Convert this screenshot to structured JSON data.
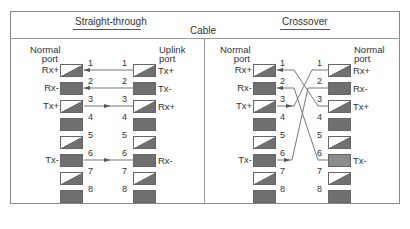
{
  "header": {
    "straight_title": "Straight-through",
    "cable_label": "Cable",
    "crossover_title": "Crossover"
  },
  "straight": {
    "left_header": [
      "Normal",
      "port"
    ],
    "right_header": [
      "Uplink",
      "port"
    ],
    "left_signals": {
      "1": "Rx+",
      "2": "Rx-",
      "3": "Tx+",
      "6": "Tx-"
    },
    "right_signals": {
      "1": "Tx+",
      "2": "Tx-",
      "3": "Rx+",
      "6": "Rx-"
    },
    "pins": [
      "1",
      "2",
      "3",
      "4",
      "5",
      "6",
      "7",
      "8"
    ],
    "connections": [
      {
        "left": 1,
        "right": 1,
        "direction": "to-left"
      },
      {
        "left": 2,
        "right": 2,
        "direction": "to-left"
      },
      {
        "left": 3,
        "right": 3,
        "direction": "to-right"
      },
      {
        "left": 6,
        "right": 6,
        "direction": "to-right"
      }
    ]
  },
  "crossover": {
    "left_header": [
      "Normal",
      "port"
    ],
    "right_header": [
      "Normal",
      "port"
    ],
    "left_signals": {
      "1": "Rx+",
      "2": "Rx-",
      "3": "Tx+",
      "6": "Tx-"
    },
    "right_signals": {
      "1": "Rx+",
      "2": "Rx-",
      "3": "Tx+",
      "6": "Tx-"
    },
    "pins": [
      "1",
      "2",
      "3",
      "4",
      "5",
      "6",
      "7",
      "8"
    ],
    "connections": [
      {
        "left": 1,
        "right": 3,
        "direction": "to-left"
      },
      {
        "left": 2,
        "right": 6,
        "direction": "to-left"
      },
      {
        "left": 3,
        "right": 1,
        "direction": "to-right"
      },
      {
        "left": 6,
        "right": 2,
        "direction": "to-right"
      }
    ]
  },
  "pin_styles": {
    "1": "half",
    "2": "solid",
    "3": "half",
    "4": "solid",
    "5": "half",
    "6": "solid",
    "7": "half",
    "8": "solid"
  },
  "colors": {
    "border": "#8a8a8a",
    "box_fill": "#6f6f6f",
    "wire": "#777777"
  }
}
